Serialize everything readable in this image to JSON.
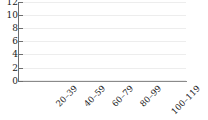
{
  "chart_data": {
    "type": "bar",
    "title": "",
    "subtitle": "",
    "xlabel": "",
    "ylabel": "",
    "categories": [
      "20–39",
      "40–59",
      "60–79",
      "80–99",
      "100–119"
    ],
    "values": [
      0,
      0,
      0,
      0,
      0
    ],
    "series": [
      {
        "name": "",
        "values": [
          0,
          0,
          0,
          0,
          0
        ]
      }
    ],
    "ylim": [
      0,
      12
    ],
    "y_ticks": [
      0,
      2,
      4,
      6,
      8,
      10,
      12
    ],
    "y_tick_labels": [
      "0",
      "2",
      "4",
      "6",
      "8",
      "10",
      "12"
    ],
    "x_tick_labels": [
      "20–39",
      "40–59",
      "60–79",
      "80–99",
      "100–119"
    ],
    "grid": true,
    "grid_axis": "y",
    "legend": false,
    "legend_position": "none",
    "annotations": [],
    "colors": {
      "background": "#ffffff",
      "gridline": "#ededed",
      "axis": "#6e6e6e",
      "x_axis": "#8a8a8a",
      "tick_text": "#1a1a1a",
      "bar": "#4a7ebb"
    }
  }
}
